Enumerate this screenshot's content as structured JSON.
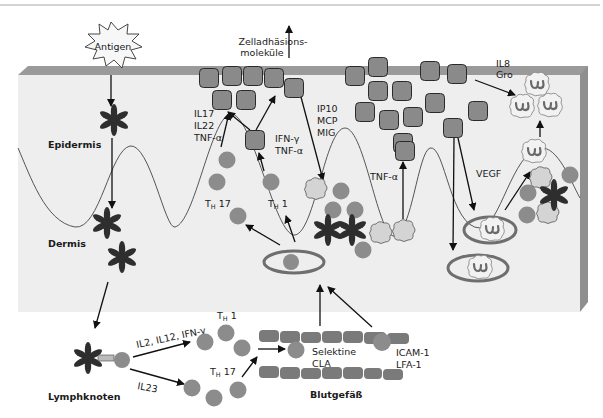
{
  "figure": {
    "header_text": "",
    "colors": {
      "tissue_fill": "#eeeeee",
      "tissue_top": "#9a9a9a",
      "tissue_side": "#8f8f8f",
      "cell_grey": "#8c8c8c",
      "adhesion_square": "#8a8a8a",
      "dendritic_cell": "#2e2e2e"
    }
  },
  "labels": {
    "antigen": "Antigen",
    "adhesion_line1": "Zelladhäsions-",
    "adhesion_line2": "moleküle",
    "epidermis": "Epidermis",
    "dermis": "Dermis",
    "lymph_node": "Lymphknoten",
    "blood_vessel": "Blutgefäß",
    "il17": "IL17",
    "il22": "IL22",
    "tnf_a_1": "TNF-α",
    "ifn_g": "IFN-γ",
    "tnf_a_2": "TNF-α",
    "ip10": "IP10",
    "mcp": "MCP",
    "mig": "MIG",
    "tnf_a_3": "TNF-α",
    "vegf": "VEGF",
    "il8": "IL8",
    "gro": "Gro",
    "th17_skin_T": "T",
    "th17_skin_sub": "H",
    "th17_skin_num": " 17",
    "th1_skin_T": "T",
    "th1_skin_sub": "H",
    "th1_skin_num": " 1",
    "th1_ln_T": "T",
    "th1_ln_sub": "H",
    "th1_ln_num": " 1",
    "th17_ln_T": "T",
    "th17_ln_sub": "H",
    "th17_ln_num": " 17",
    "il2_il12_ifng": "IL2, IL12, IFN-γ",
    "il23": "IL23",
    "selektine": "Selektine",
    "cla": "CLA",
    "icam1": "ICAM-1",
    "lfa1": "LFA-1"
  },
  "regions": [
    {
      "name": "Epidermis"
    },
    {
      "name": "Dermis"
    },
    {
      "name": "Lymphknoten"
    },
    {
      "name": "Blutgefäß"
    }
  ],
  "icons": {
    "antigen": "starburst-icon",
    "dendritic_cell": "dendritic-cell-icon",
    "t_cell": "t-cell-icon",
    "adhesion_molecule": "adhesion-molecule-icon",
    "macrophage": "macrophage-icon",
    "neutrophil": "neutrophil-icon",
    "blood_vessel": "blood-vessel-icon"
  }
}
